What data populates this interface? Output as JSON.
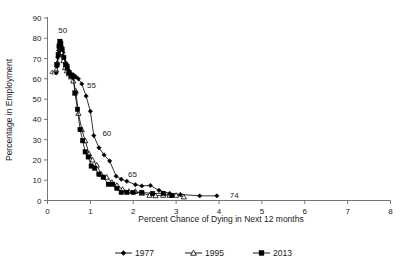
{
  "chart_data": {
    "type": "line",
    "title": "",
    "xlabel": "Percent Chance of Dying in Next 12 months",
    "ylabel": "Percentage in Employment",
    "xlim": [
      0,
      8
    ],
    "ylim": [
      0,
      90
    ],
    "xticks": [
      "0",
      "1",
      "2",
      "3",
      "4",
      "5",
      "6",
      "7",
      "8"
    ],
    "yticks": [
      "0",
      "10",
      "20",
      "30",
      "40",
      "50",
      "60",
      "70",
      "80",
      "90"
    ],
    "grid": false,
    "legend_position": "bottom",
    "series": [
      {
        "name": "1977",
        "marker": "filled-diamond",
        "color": "#000000",
        "points": [
          [
            0.2,
            63.0
          ],
          [
            0.22,
            66.0
          ],
          [
            0.24,
            70.5
          ],
          [
            0.26,
            74.0
          ],
          [
            0.28,
            77.5
          ],
          [
            0.3,
            78.5
          ],
          [
            0.33,
            76.0
          ],
          [
            0.36,
            73.0
          ],
          [
            0.4,
            68.5
          ],
          [
            0.43,
            66.5
          ],
          [
            0.46,
            67.0
          ],
          [
            0.5,
            64.0
          ],
          [
            0.55,
            62.5
          ],
          [
            0.6,
            62.0
          ],
          [
            0.66,
            61.0
          ],
          [
            0.72,
            60.0
          ],
          [
            0.8,
            57.5
          ],
          [
            0.9,
            51.5
          ],
          [
            1.0,
            44.0
          ],
          [
            1.08,
            32.0
          ],
          [
            1.2,
            26.0
          ],
          [
            1.32,
            22.5
          ],
          [
            1.45,
            19.5
          ],
          [
            1.6,
            12.0
          ],
          [
            1.72,
            10.5
          ],
          [
            1.85,
            9.5
          ],
          [
            2.05,
            7.8
          ],
          [
            2.2,
            7.2
          ],
          [
            2.4,
            7.4
          ],
          [
            2.6,
            5.0
          ],
          [
            2.85,
            3.5
          ],
          [
            3.1,
            3.0
          ],
          [
            3.55,
            2.3
          ],
          [
            3.95,
            2.3
          ]
        ]
      },
      {
        "name": "1995",
        "marker": "open-triangle",
        "color": "#000000",
        "points": [
          [
            0.2,
            64.5
          ],
          [
            0.23,
            68.0
          ],
          [
            0.26,
            72.0
          ],
          [
            0.28,
            75.0
          ],
          [
            0.3,
            75.5
          ],
          [
            0.33,
            73.0
          ],
          [
            0.37,
            69.0
          ],
          [
            0.41,
            65.5
          ],
          [
            0.45,
            64.0
          ],
          [
            0.5,
            62.5
          ],
          [
            0.55,
            61.0
          ],
          [
            0.6,
            59.0
          ],
          [
            0.66,
            54.0
          ],
          [
            0.72,
            43.0
          ],
          [
            0.8,
            35.0
          ],
          [
            0.88,
            29.5
          ],
          [
            0.97,
            23.0
          ],
          [
            1.05,
            20.0
          ],
          [
            1.15,
            17.5
          ],
          [
            1.25,
            13.0
          ],
          [
            1.38,
            11.5
          ],
          [
            1.5,
            9.0
          ],
          [
            1.62,
            7.5
          ],
          [
            1.75,
            5.5
          ],
          [
            1.9,
            4.5
          ],
          [
            2.05,
            4.5
          ],
          [
            2.2,
            3.6
          ],
          [
            2.38,
            2.6
          ],
          [
            2.52,
            2.4
          ],
          [
            2.7,
            2.6
          ],
          [
            2.85,
            2.6
          ],
          [
            3.0,
            2.6
          ],
          [
            3.18,
            1.8
          ]
        ]
      },
      {
        "name": "2013",
        "marker": "filled-square",
        "color": "#000000",
        "points": [
          [
            0.22,
            67.0
          ],
          [
            0.25,
            72.0
          ],
          [
            0.27,
            76.0
          ],
          [
            0.29,
            78.5
          ],
          [
            0.31,
            77.5
          ],
          [
            0.34,
            74.5
          ],
          [
            0.38,
            70.5
          ],
          [
            0.42,
            67.0
          ],
          [
            0.46,
            65.5
          ],
          [
            0.5,
            63.0
          ],
          [
            0.55,
            61.5
          ],
          [
            0.6,
            61.0
          ],
          [
            0.64,
            53.0
          ],
          [
            0.7,
            45.0
          ],
          [
            0.76,
            35.0
          ],
          [
            0.82,
            29.5
          ],
          [
            0.88,
            24.0
          ],
          [
            0.95,
            21.5
          ],
          [
            1.02,
            17.0
          ],
          [
            1.1,
            16.0
          ],
          [
            1.2,
            13.0
          ],
          [
            1.3,
            11.5
          ],
          [
            1.42,
            8.0
          ],
          [
            1.52,
            8.0
          ],
          [
            1.62,
            6.0
          ],
          [
            1.72,
            4.0
          ],
          [
            1.85,
            4.0
          ],
          [
            2.0,
            4.0
          ],
          [
            2.2,
            4.0
          ],
          [
            2.45,
            3.5
          ],
          [
            2.7,
            3.5
          ],
          [
            2.9,
            2.5
          ]
        ]
      }
    ],
    "annotations": [
      {
        "text": "50",
        "x": 0.25,
        "y": 84.0
      },
      {
        "text": "43",
        "x": 0.04,
        "y": 63.5
      },
      {
        "text": "55",
        "x": 0.92,
        "y": 57.0
      },
      {
        "text": "60",
        "x": 1.28,
        "y": 33.5
      },
      {
        "text": "65",
        "x": 1.88,
        "y": 13.0
      },
      {
        "text": "74",
        "x": 4.25,
        "y": 2.8
      }
    ]
  },
  "legend": {
    "items": [
      {
        "label": "1977",
        "marker": "filled-diamond"
      },
      {
        "label": "1995",
        "marker": "open-triangle"
      },
      {
        "label": "2013",
        "marker": "filled-square"
      }
    ]
  }
}
